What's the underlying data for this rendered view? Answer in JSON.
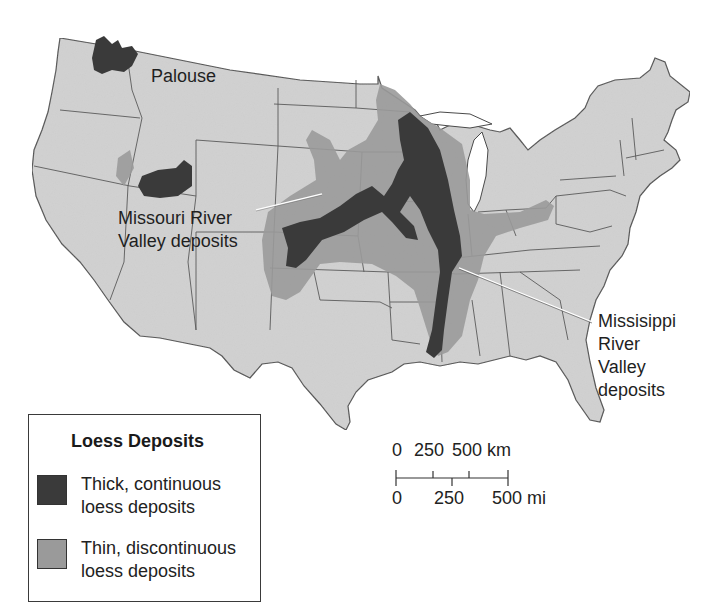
{
  "map": {
    "title": "Loess Deposits of the United States",
    "colors": {
      "land": "#d2d2d2",
      "state_border": "#5a5a5a",
      "thick_deposit": "#3a3a3a",
      "thin_deposit": "#9a9a9a",
      "water": "#ffffff"
    },
    "labels": {
      "palouse": "Palouse",
      "missouri_line1": "Missouri River",
      "missouri_line2": "Valley deposits",
      "mississippi_line1": "Missisippi",
      "mississippi_line2": "River",
      "mississippi_line3": "Valley",
      "mississippi_line4": "deposits"
    }
  },
  "legend": {
    "title": "Loess Deposits",
    "items": [
      {
        "line1": "Thick, continuous",
        "line2": "loess deposits",
        "color": "#3a3a3a"
      },
      {
        "line1": "Thin, discontinuous",
        "line2": "loess deposits",
        "color": "#9a9a9a"
      }
    ]
  },
  "scale_bar": {
    "km_labels": [
      "0",
      "250",
      "500 km"
    ],
    "mi_labels": [
      "0",
      "250",
      "500 mi"
    ]
  }
}
